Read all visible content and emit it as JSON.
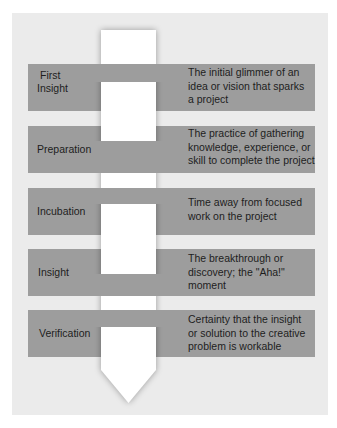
{
  "colors": {
    "panel_bg": "#ebebeb",
    "band": "#9d9d9d",
    "arrow": "#ffffff",
    "text": "#1e1e1e"
  },
  "diagram": {
    "type": "vertical-process-arrow",
    "stages": [
      {
        "label": "First Insight",
        "label_lines": [
          "First",
          "Insight"
        ],
        "description": "The initial glimmer of an idea or vision that sparks a project",
        "description_lines": [
          "The initial glimmer of an",
          "idea or vision that sparks",
          "a project"
        ]
      },
      {
        "label": "Preparation",
        "label_lines": [
          "Preparation"
        ],
        "description": "The practice of gathering knowledge, experience, or skill to complete the project",
        "description_lines": [
          "The practice of gathering",
          "knowledge, experience, or",
          "skill to complete the project"
        ]
      },
      {
        "label": "Incubation",
        "label_lines": [
          "Incubation"
        ],
        "description": "Time away from focused work on the project",
        "description_lines": [
          "Time away from focused",
          "work on the project"
        ]
      },
      {
        "label": "Insight",
        "label_lines": [
          "Insight"
        ],
        "description": "The breakthrough or discovery; the \"Aha!\" moment",
        "description_lines": [
          "The breakthrough or",
          "discovery; the \"Aha!\"",
          "moment"
        ]
      },
      {
        "label": "Verification",
        "label_lines": [
          "Verification"
        ],
        "description": "Certainty that the insight or solution to the creative problem is workable",
        "description_lines": [
          "Certainty that the insight",
          "or solution to the creative",
          "problem is workable"
        ]
      }
    ]
  }
}
